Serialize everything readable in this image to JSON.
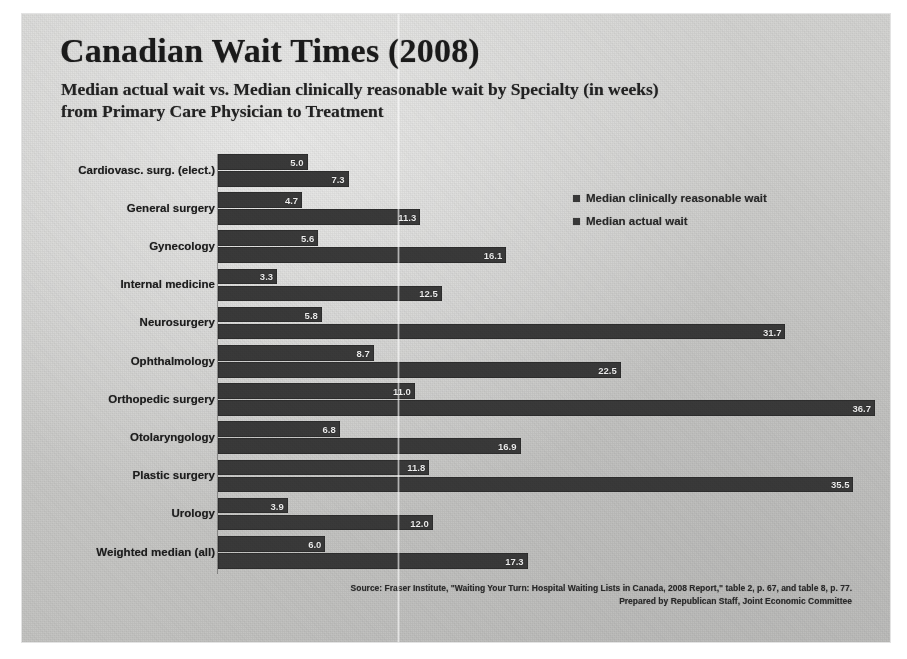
{
  "title": "Canadian Wait Times (2008)",
  "subtitle_line1": "Median actual wait vs. Median clinically reasonable wait by Specialty (in weeks)",
  "subtitle_line2": "from Primary Care Physician to Treatment",
  "legend": {
    "items": [
      {
        "label": "Median clinically reasonable wait",
        "color": "#3a3a3a"
      },
      {
        "label": "Median actual wait",
        "color": "#3a3a3a"
      }
    ]
  },
  "footer": {
    "line1": "Source: Fraser Institute, \"Waiting Your Turn: Hospital Waiting Lists in Canada, 2008 Report,\" table 2, p. 67, and table 8, p. 77.",
    "line2": "Prepared by Republican Staff, Joint Economic Committee"
  },
  "chart_data": {
    "type": "bar",
    "orientation": "horizontal",
    "title": "Canadian Wait Times (2008)",
    "subtitle": "Median actual wait vs. Median clinically reasonable wait by Specialty (in weeks) from Primary Care Physician to Treatment",
    "xlabel": "Weeks",
    "ylabel": "Specialty",
    "xlim": [
      0,
      38
    ],
    "grid": false,
    "legend_position": "top-right",
    "categories": [
      "Cardiovasc. surg. (elect.)",
      "General surgery",
      "Gynecology",
      "Internal medicine",
      "Neurosurgery",
      "Ophthalmology",
      "Orthopedic surgery",
      "Otolaryngology",
      "Plastic surgery",
      "Urology",
      "Weighted median (all)"
    ],
    "series": [
      {
        "name": "Median clinically reasonable wait",
        "color": "#3a3a3a",
        "values": [
          5.0,
          4.7,
          5.6,
          3.3,
          5.8,
          8.7,
          11.0,
          6.8,
          11.8,
          3.9,
          6.0
        ],
        "labels": [
          "5.0",
          "4.7",
          "5.6",
          "3.3",
          "5.8",
          "8.7",
          "11.0",
          "6.8",
          "11.8",
          "3.9",
          "6.0"
        ]
      },
      {
        "name": "Median actual wait",
        "color": "#3a3a3a",
        "values": [
          7.3,
          11.3,
          16.1,
          12.5,
          31.7,
          22.5,
          36.7,
          16.9,
          35.5,
          12.0,
          17.3
        ],
        "labels": [
          "7.3",
          "11.3",
          "16.1",
          "12.5",
          "31.7",
          "22.5",
          "36.7",
          "16.9",
          "35.5",
          "12.0",
          "17.3"
        ]
      }
    ]
  }
}
